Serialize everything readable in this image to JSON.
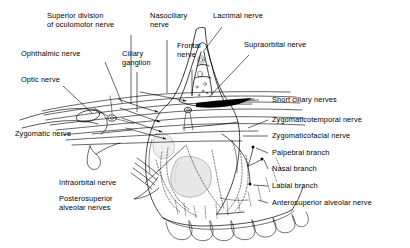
{
  "figure": {
    "background_color": "#ffffff",
    "line_color": "#000000",
    "width": 410,
    "height": 248
  },
  "labels": {
    "superior_division_oculomotor": "Superior division\nof oculomotor nerve",
    "nasociliary": "Nasociliary\nnerve",
    "lacrimal": "Lacrimal nerve",
    "ophthalmic": "Ophthalmic nerve",
    "ciliary_ganglion": "Ciliary\nganglion",
    "frontal": "Frontal\nnerve",
    "supraorbital": "Supraorbital nerve",
    "optic": "Optic nerve",
    "short_ciliary": "Short ciliary nerves",
    "zygomaticotemporal": "Zygomaticotemporal nerve",
    "zygomaticofacial": "Zygomaticofacial nerve",
    "zygomatic": "Zygomatic nerve",
    "palpebral_branch": "Palpebral branch",
    "nasal_branch": "Nasal branch",
    "infraorbital": "Infraorbital nerve",
    "labial_branch": "Labial branch",
    "posterosuperior_alveolar": "Posterosuperior\nalveolar nerves",
    "anterosuperior_alveolar": "Anterosuperior alveolar nerve"
  }
}
